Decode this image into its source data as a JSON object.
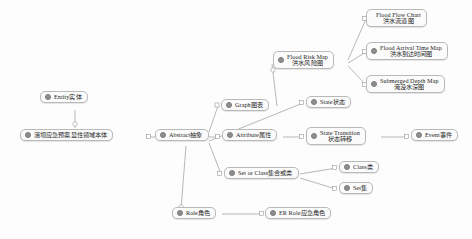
{
  "diagram": {
    "type": "mind-map",
    "title": "",
    "background_color": "#fdfdfd",
    "node_fill": "#fbfbfb",
    "node_border": "#b9b9b9",
    "edge_color": "#9a9a9a",
    "bullet_color": "#8e8e8e"
  },
  "nodes": {
    "root": {
      "en": "",
      "zh": "溃坝应急预案显性领域本体"
    },
    "entity": {
      "en": "Entity",
      "zh": "实体"
    },
    "abstract": {
      "en": "Abstract",
      "zh": "抽象"
    },
    "graph": {
      "en": "Graph",
      "zh": "图表"
    },
    "attribute": {
      "en": "Attribute",
      "zh": "属性"
    },
    "set_or_class": {
      "en": "Set or Class",
      "zh": "集合或类"
    },
    "role": {
      "en": "Role",
      "zh": "角色"
    },
    "er_role": {
      "en": "ER Role",
      "zh": "应急角色"
    },
    "flood_risk_map": {
      "en": "Flood Risk Map",
      "zh": "洪水风险图"
    },
    "flood_flow_chart": {
      "en": "Flood Flow Chart",
      "zh": "洪水流道图"
    },
    "flood_arrival_time_map": {
      "en": "Flood Arrival Time Map",
      "zh": "洪水到达时间图"
    },
    "submerged_depth_map": {
      "en": "Submerged Depth Map",
      "zh": "淹没水深图"
    },
    "state": {
      "en": "State",
      "zh": "状态"
    },
    "state_transition": {
      "en": "State Transition",
      "zh": "状态转移"
    },
    "event": {
      "en": "Event",
      "zh": "事件"
    },
    "klass": {
      "en": "Class",
      "zh": "类"
    },
    "set": {
      "en": "Set",
      "zh": "集"
    }
  },
  "edges": [
    {
      "from": "entity",
      "to": "root"
    },
    {
      "from": "root",
      "to": "abstract"
    },
    {
      "from": "abstract",
      "to": "graph"
    },
    {
      "from": "abstract",
      "to": "attribute"
    },
    {
      "from": "abstract",
      "to": "state"
    },
    {
      "from": "abstract",
      "to": "set_or_class"
    },
    {
      "from": "abstract",
      "to": "role"
    },
    {
      "from": "role",
      "to": "er_role"
    },
    {
      "from": "graph",
      "to": "flood_risk_map"
    },
    {
      "from": "flood_risk_map",
      "to": "flood_flow_chart"
    },
    {
      "from": "flood_risk_map",
      "to": "flood_arrival_time_map"
    },
    {
      "from": "flood_risk_map",
      "to": "submerged_depth_map"
    },
    {
      "from": "attribute",
      "to": "state_transition"
    },
    {
      "from": "state_transition",
      "to": "event"
    },
    {
      "from": "set_or_class",
      "to": "klass"
    },
    {
      "from": "set_or_class",
      "to": "set"
    }
  ]
}
